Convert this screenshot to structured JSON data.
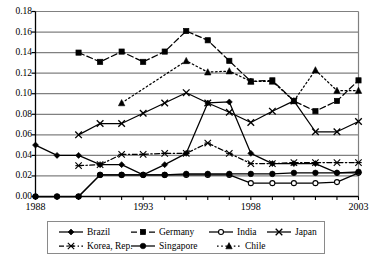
{
  "chart_data": {
    "type": "line",
    "title": "",
    "subtitle": "",
    "xlabel": "",
    "ylabel": "",
    "xlim": [
      1988,
      2003
    ],
    "ylim": [
      0.0,
      0.18
    ],
    "grid": "horizontal",
    "legend_position": "bottom",
    "x_tick_labels": [
      "1988",
      "1993",
      "1998",
      "2003"
    ],
    "x_tick_values": [
      1988,
      1993,
      1998,
      2003
    ],
    "x_all_ticks": [
      1988,
      1989,
      1990,
      1991,
      1992,
      1993,
      1994,
      1995,
      1996,
      1997,
      1998,
      1999,
      2000,
      2001,
      2002,
      2003
    ],
    "y_tick_labels": [
      "0.00",
      "0.02",
      "0.04",
      "0.06",
      "0.08",
      "0.10",
      "0.12",
      "0.14",
      "0.16",
      "0.18"
    ],
    "y_tick_values": [
      0.0,
      0.02,
      0.04,
      0.06,
      0.08,
      0.1,
      0.12,
      0.14,
      0.16,
      0.18
    ],
    "series": [
      {
        "name": "Brazil",
        "marker": "diamond",
        "dash": "solid",
        "x": [
          1988,
          1989,
          1990,
          1991,
          1992,
          1993,
          1994,
          1995,
          1996,
          1997,
          1998,
          1999,
          2000,
          2001,
          2002,
          2003
        ],
        "values": [
          0.05,
          0.04,
          0.04,
          0.031,
          0.031,
          0.021,
          0.031,
          0.042,
          0.091,
          0.092,
          0.042,
          0.032,
          0.032,
          0.032,
          0.023,
          0.023
        ]
      },
      {
        "name": "Germany",
        "marker": "square",
        "dash": "dashed",
        "x": [
          1990,
          1991,
          1992,
          1993,
          1994,
          1995,
          1996,
          1997,
          1998,
          1999,
          2000,
          2001,
          2002,
          2003
        ],
        "values": [
          0.14,
          0.131,
          0.141,
          0.131,
          0.141,
          0.161,
          0.152,
          0.132,
          0.112,
          0.113,
          0.093,
          0.083,
          0.093,
          0.113
        ]
      },
      {
        "name": "India",
        "marker": "open-circle",
        "dash": "solid",
        "x": [
          1988,
          1989,
          1990,
          1991,
          1992,
          1993,
          1994,
          1995,
          1996,
          1997,
          1998,
          1999,
          2000,
          2001,
          2002,
          2003
        ],
        "values": [
          0.0,
          0.0,
          0.0,
          0.021,
          0.021,
          0.021,
          0.021,
          0.021,
          0.021,
          0.021,
          0.013,
          0.013,
          0.013,
          0.013,
          0.014,
          0.023
        ]
      },
      {
        "name": "Japan",
        "marker": "cross",
        "dash": "solid",
        "x": [
          1990,
          1991,
          1992,
          1993,
          1994,
          1995,
          1996,
          1997,
          1998,
          1999,
          2000,
          2001,
          2002,
          2003
        ],
        "values": [
          0.06,
          0.071,
          0.071,
          0.081,
          0.091,
          0.101,
          0.091,
          0.082,
          0.072,
          0.083,
          0.093,
          0.063,
          0.063,
          0.073
        ]
      },
      {
        "name": "Korea, Rep.",
        "marker": "star",
        "dash": "dash-dot",
        "x": [
          1990,
          1991,
          1992,
          1993,
          1994,
          1995,
          1996,
          1997,
          1998,
          1999,
          2000,
          2001,
          2002,
          2003
        ],
        "values": [
          0.03,
          0.031,
          0.041,
          0.041,
          0.042,
          0.042,
          0.052,
          0.042,
          0.032,
          0.032,
          0.033,
          0.033,
          0.033,
          0.033
        ]
      },
      {
        "name": "Singapore",
        "marker": "filled-circle",
        "dash": "solid",
        "x": [
          1988,
          1989,
          1990,
          1991,
          1992,
          1993,
          1994,
          1995,
          1996,
          1997,
          1998,
          1999,
          2000,
          2001,
          2002,
          2003
        ],
        "values": [
          0.0,
          0.0,
          0.0,
          0.021,
          0.021,
          0.021,
          0.021,
          0.022,
          0.022,
          0.022,
          0.022,
          0.022,
          0.023,
          0.023,
          0.023,
          0.024
        ]
      },
      {
        "name": "Chile",
        "marker": "triangle",
        "dash": "dotted",
        "x": [
          1992,
          1995,
          1996,
          1997,
          1998,
          1999,
          2000,
          2001,
          2002,
          2003
        ],
        "values": [
          0.091,
          0.132,
          0.121,
          0.122,
          0.112,
          0.112,
          0.093,
          0.123,
          0.103,
          0.103
        ]
      }
    ]
  },
  "legend": {
    "rows": [
      [
        {
          "label": "Brazil",
          "marker": "diamond",
          "dash": "solid"
        },
        {
          "label": "Germany",
          "marker": "square",
          "dash": "dashed"
        },
        {
          "label": "India",
          "marker": "open-circle",
          "dash": "solid"
        },
        {
          "label": "Japan",
          "marker": "cross",
          "dash": "solid"
        }
      ],
      [
        {
          "label": "Korea, Rep.",
          "marker": "star",
          "dash": "dash-dot"
        },
        {
          "label": "Singapore",
          "marker": "filled-circle",
          "dash": "solid"
        },
        {
          "label": "Chile",
          "marker": "triangle",
          "dash": "dotted"
        }
      ]
    ]
  },
  "colors": {
    "axis": "#000000",
    "grid": "#808080",
    "series": "#000000",
    "background": "#ffffff",
    "legend_border": "#8a8a8a"
  }
}
